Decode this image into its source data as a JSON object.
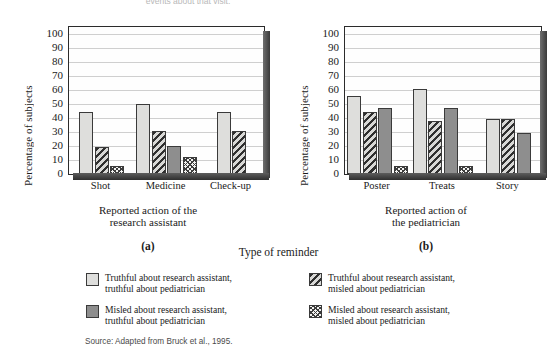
{
  "top_caption": "events about that visit.",
  "legend_title": "Type of reminder",
  "source": "Source: Adapted from Bruck et al., 1995.",
  "legend": {
    "items": [
      {
        "id": "truthful-truthful",
        "pattern": "solid-light-gray",
        "line1": "Truthful about research assistant,",
        "line2": "truthful about pediatrician"
      },
      {
        "id": "truthful-misled",
        "pattern": "diagonal-hatch-dark",
        "line1": "Truthful about research assistant,",
        "line2": "misled about pediatrician"
      },
      {
        "id": "misled-truthful",
        "pattern": "solid-medium-gray",
        "line1": "Misled about research assistant,",
        "line2": "truthful about pediatrician"
      },
      {
        "id": "misled-misled",
        "pattern": "checkerboard",
        "line1": "Misled about research assistant,",
        "line2": "misled about pediatrician"
      }
    ]
  },
  "panels": [
    {
      "tag": "(a)",
      "ylabel": "Percentage of subjects",
      "xlabel_line1": "Reported action of the",
      "xlabel_line2": "research assistant"
    },
    {
      "tag": "(b)",
      "ylabel": "Percentage of subjects",
      "xlabel_line1": "Reported action of",
      "xlabel_line2": "the pediatrician"
    }
  ],
  "chart_data": [
    {
      "type": "bar",
      "panel": "(a)",
      "title": "",
      "xlabel": "Reported action of the research assistant",
      "ylabel": "Percentage of subjects",
      "categories": [
        "Shot",
        "Medicine",
        "Check-up"
      ],
      "yticks": [
        0,
        10,
        20,
        30,
        40,
        50,
        60,
        70,
        80,
        90,
        100
      ],
      "ylim": [
        0,
        105
      ],
      "grid": true,
      "legend_position": "below-shared",
      "series": [
        {
          "name": "Truthful about research assistant, truthful about pediatrician",
          "pattern": "solid-light-gray",
          "values": [
            44,
            50,
            44
          ]
        },
        {
          "name": "Truthful about research assistant, misled about pediatrician",
          "pattern": "diagonal-hatch-dark",
          "values": [
            19,
            31,
            31
          ]
        },
        {
          "name": "Misled about research assistant, truthful about pediatrician",
          "pattern": "solid-medium-gray",
          "values": [
            0,
            20,
            0
          ]
        },
        {
          "name": "Misled about research assistant, misled about pediatrician",
          "pattern": "checkerboard",
          "values": [
            6,
            12,
            0
          ]
        }
      ]
    },
    {
      "type": "bar",
      "panel": "(b)",
      "title": "",
      "xlabel": "Reported action of the pediatrician",
      "ylabel": "Percentage of subjects",
      "categories": [
        "Poster",
        "Treats",
        "Story"
      ],
      "yticks": [
        0,
        10,
        20,
        30,
        40,
        50,
        60,
        70,
        80,
        90,
        100
      ],
      "ylim": [
        0,
        105
      ],
      "grid": true,
      "legend_position": "below-shared",
      "series": [
        {
          "name": "Truthful about research assistant, truthful about pediatrician",
          "pattern": "solid-light-gray",
          "values": [
            56,
            61,
            39
          ]
        },
        {
          "name": "Truthful about research assistant, misled about pediatrician",
          "pattern": "diagonal-hatch-dark",
          "values": [
            44,
            38,
            39
          ]
        },
        {
          "name": "Misled about research assistant, truthful about pediatrician",
          "pattern": "solid-medium-gray",
          "values": [
            47,
            47,
            29
          ]
        },
        {
          "name": "Misled about research assistant, misled about pediatrician",
          "pattern": "checkerboard",
          "values": [
            6,
            6,
            0
          ]
        }
      ]
    }
  ]
}
